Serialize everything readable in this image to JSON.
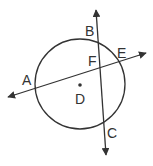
{
  "diagram": {
    "type": "circle with intersecting lines",
    "circle": {
      "center_label": "D",
      "cx": 80,
      "cy": 84,
      "r": 45
    },
    "points": [
      {
        "label": "A",
        "x": 35,
        "y": 88,
        "label_x": 20,
        "label_y": 85
      },
      {
        "label": "B",
        "x": 93,
        "y": 40,
        "label_x": 85,
        "label_y": 36
      },
      {
        "label": "E",
        "x": 118,
        "y": 61,
        "label_x": 119,
        "label_y": 58
      },
      {
        "label": "F",
        "x": 100,
        "y": 68,
        "label_x": 88,
        "label_y": 66
      },
      {
        "label": "D",
        "x": 80,
        "y": 85,
        "label_x": 75,
        "label_y": 104
      },
      {
        "label": "C",
        "x": 105,
        "y": 128,
        "label_x": 106,
        "label_y": 138
      }
    ],
    "lines": [
      {
        "name": "line-BC",
        "x1": 96,
        "y1": 10,
        "x2": 106,
        "y2": 155,
        "arrows": "both"
      },
      {
        "name": "line-AE",
        "x1": 8,
        "y1": 97,
        "x2": 146,
        "y2": 53,
        "arrows": "both"
      }
    ],
    "colors": {
      "stroke": "#333333",
      "label": "#333333"
    }
  }
}
